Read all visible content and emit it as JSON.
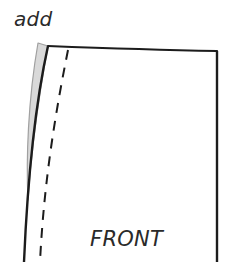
{
  "diagram": {
    "type": "sewing-pattern-piece",
    "annotations": {
      "add_label": "add",
      "piece_label": "FRONT"
    },
    "colors": {
      "outline": "#1c1c1c",
      "added_area_fill": "#d9d9d9",
      "added_area_stroke": "#9a9a9a",
      "text": "#2a2a2a",
      "background": "#ffffff"
    },
    "elements": [
      {
        "name": "added-allowance-wedge",
        "style": "gray filled"
      },
      {
        "name": "side-seam-line",
        "style": "solid curved"
      },
      {
        "name": "stitch-line",
        "style": "dashed"
      },
      {
        "name": "waist-line",
        "style": "solid"
      },
      {
        "name": "center-front-line",
        "style": "solid vertical"
      }
    ]
  }
}
